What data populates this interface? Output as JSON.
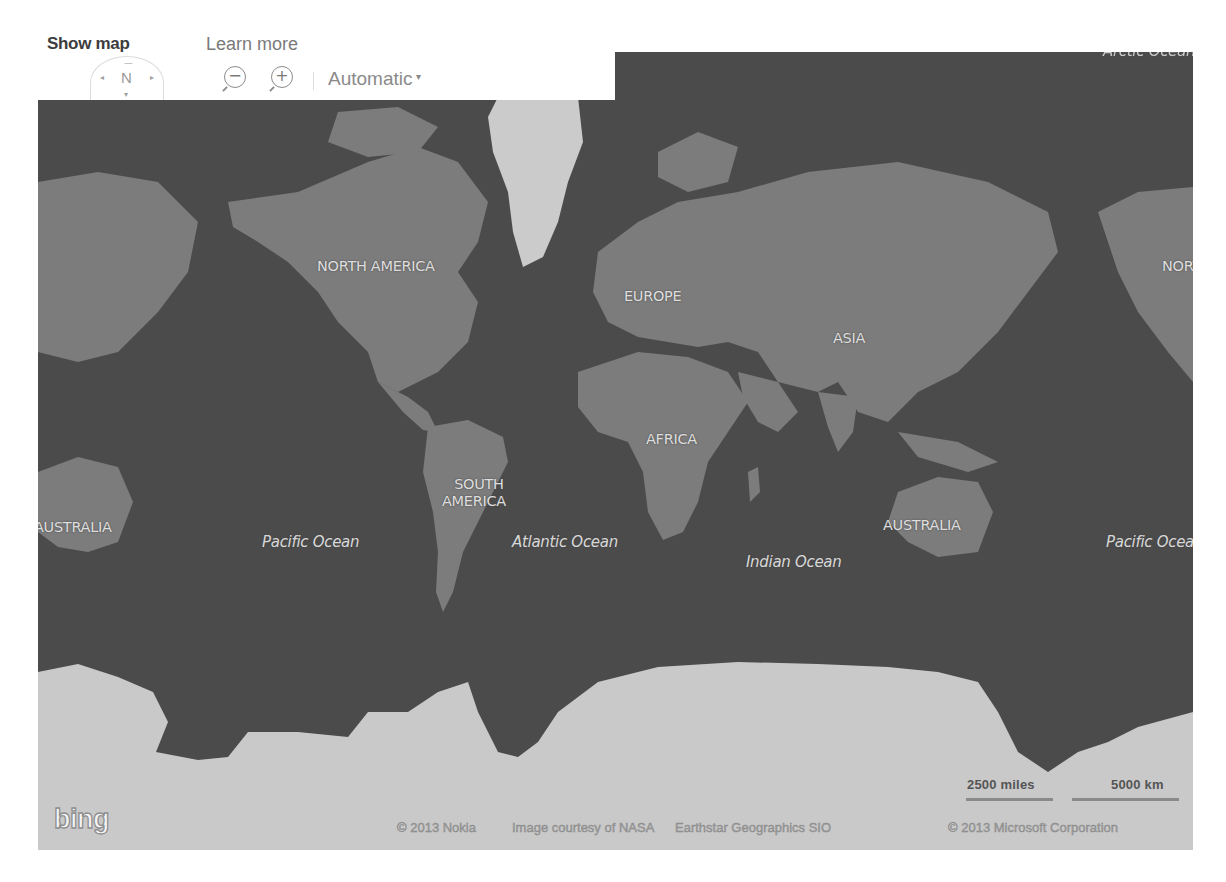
{
  "controls": {
    "show_map_label": "Show map",
    "learn_more_label": "Learn more",
    "compass": {
      "north_label": "N",
      "left_icon": "◂",
      "right_icon": "▸",
      "up_icon": "—",
      "down_icon": "▾"
    },
    "zoom_out_icon": "−",
    "zoom_in_icon": "+",
    "map_style_value": "Automatic",
    "map_style_caret": "▾"
  },
  "map": {
    "colors": {
      "ocean": "#2f2f2f",
      "land": "#7b7b7b",
      "ice": "#f2f2f2",
      "label": "#dedede"
    },
    "continent_labels": {
      "north_america": "NORTH AMERICA",
      "north_america_right": "NORTH AMERICA",
      "europe": "EUROPE",
      "asia": "ASIA",
      "africa": "AFRICA",
      "south_america_line1": "SOUTH",
      "south_america_line2": "AMERICA",
      "australia_left": "AUSTRALIA",
      "australia_right": "AUSTRALIA"
    },
    "ocean_labels": {
      "pacific_left": "Pacific Ocean",
      "atlantic": "Atlantic Ocean",
      "indian": "Indian Ocean",
      "pacific_right": "Pacific Ocean",
      "arctic": "Arctic Ocean"
    },
    "scale": {
      "miles_label": "2500 miles",
      "km_label": "5000 km"
    },
    "logo_text": "bing",
    "attribution": {
      "nokia": "© 2013 Nokia",
      "nasa": "Image courtesy of NASA",
      "earthstar": "Earthstar Geographics SIO",
      "microsoft": "© 2013 Microsoft Corporation"
    }
  }
}
